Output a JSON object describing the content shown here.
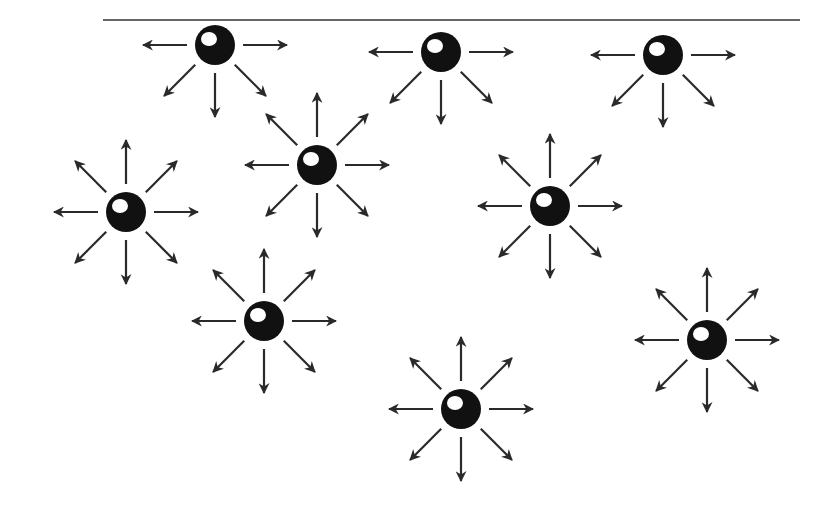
{
  "diagram": {
    "colors": {
      "background": "#ffffff",
      "line": "#333333",
      "arrow": "#2a2a2a",
      "sphere": "#111111",
      "highlight": "#ffffff"
    },
    "surface_line": {
      "x1": 103,
      "y1": 20,
      "x2": 800,
      "y2": 20
    },
    "molecules": [
      {
        "id": "surface-1",
        "cx": 215,
        "cy": 45,
        "r": 20,
        "type": "surface",
        "directions": [
          "W",
          "E",
          "SW",
          "S",
          "SE"
        ]
      },
      {
        "id": "surface-2",
        "cx": 441,
        "cy": 52,
        "r": 20,
        "type": "surface",
        "directions": [
          "W",
          "E",
          "SW",
          "S",
          "SE"
        ]
      },
      {
        "id": "surface-3",
        "cx": 663,
        "cy": 55,
        "r": 20,
        "type": "surface",
        "directions": [
          "W",
          "E",
          "SW",
          "S",
          "SE"
        ]
      },
      {
        "id": "bulk-1",
        "cx": 317,
        "cy": 165,
        "r": 20,
        "type": "bulk",
        "directions": [
          "N",
          "NE",
          "E",
          "SE",
          "S",
          "SW",
          "W",
          "NW"
        ]
      },
      {
        "id": "bulk-2",
        "cx": 126,
        "cy": 212,
        "r": 20,
        "type": "bulk",
        "directions": [
          "N",
          "NE",
          "E",
          "SE",
          "S",
          "SW",
          "W",
          "NW"
        ]
      },
      {
        "id": "bulk-3",
        "cx": 550,
        "cy": 206,
        "r": 20,
        "type": "bulk",
        "directions": [
          "N",
          "NE",
          "E",
          "SE",
          "S",
          "SW",
          "W",
          "NW"
        ]
      },
      {
        "id": "bulk-4",
        "cx": 264,
        "cy": 321,
        "r": 20,
        "type": "bulk",
        "directions": [
          "N",
          "NE",
          "E",
          "SE",
          "S",
          "SW",
          "W",
          "NW"
        ]
      },
      {
        "id": "bulk-5",
        "cx": 707,
        "cy": 340,
        "r": 20,
        "type": "bulk",
        "directions": [
          "N",
          "NE",
          "E",
          "SE",
          "S",
          "SW",
          "W",
          "NW"
        ]
      },
      {
        "id": "bulk-6",
        "cx": 461,
        "cy": 409,
        "r": 20,
        "type": "bulk",
        "directions": [
          "N",
          "NE",
          "E",
          "SE",
          "S",
          "SW",
          "W",
          "NW"
        ]
      }
    ],
    "arrow": {
      "start_offset": 28,
      "length": 44,
      "stroke_width": 2.2
    }
  }
}
